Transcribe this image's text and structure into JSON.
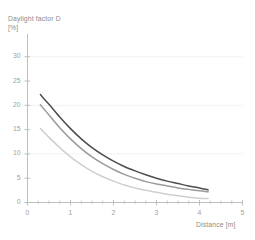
{
  "chart_data": {
    "type": "line",
    "title": "",
    "ylabel": "Daylight factor D",
    "yunit": "[%]",
    "xlabel": "Distance [m]",
    "xlim": [
      0,
      5
    ],
    "ylim": [
      0,
      32
    ],
    "grid": true,
    "grid_axis": "y",
    "legend": "none",
    "xticks": [
      0,
      1,
      2,
      3,
      4,
      5
    ],
    "xtick_labels": [
      "0",
      "1",
      "2",
      "3",
      "4",
      "5"
    ],
    "yticks": [
      0,
      5,
      10,
      15,
      20,
      25,
      30
    ],
    "ytick_labels": [
      "0",
      "5",
      "10",
      "15",
      "20",
      "25",
      "30"
    ],
    "xminor_ticks": [
      0.25,
      0.5,
      0.75,
      1.25,
      1.5,
      1.75,
      2.25,
      2.5,
      2.75,
      3.25,
      3.5,
      3.75,
      4.25,
      4.5,
      4.75
    ],
    "gridlines_y": [
      10,
      20,
      30
    ],
    "x": [
      0.3,
      0.5,
      0.75,
      1.0,
      1.25,
      1.5,
      1.75,
      2.0,
      2.25,
      2.5,
      2.75,
      3.0,
      3.25,
      3.5,
      3.75,
      4.0,
      4.2
    ],
    "series": [
      {
        "name": "curve-dark",
        "color": "#4d4d4d",
        "values": [
          22.2,
          20.2,
          17.6,
          15.2,
          13.1,
          11.3,
          9.8,
          8.5,
          7.4,
          6.5,
          5.7,
          5.0,
          4.4,
          3.9,
          3.4,
          3.0,
          2.6
        ]
      },
      {
        "name": "curve-medium",
        "color": "#9b9b9b",
        "values": [
          20.1,
          18.0,
          15.4,
          13.1,
          11.1,
          9.4,
          8.0,
          6.8,
          5.8,
          5.0,
          4.3,
          3.8,
          3.4,
          3.0,
          2.7,
          2.4,
          2.2
        ]
      },
      {
        "name": "curve-light",
        "color": "#cfcfcf",
        "values": [
          15.2,
          13.4,
          11.3,
          9.4,
          7.8,
          6.4,
          5.3,
          4.4,
          3.6,
          3.0,
          2.5,
          2.1,
          1.7,
          1.4,
          1.1,
          0.9,
          0.8
        ]
      }
    ],
    "colors": {
      "axis": "#bfbfbf",
      "grid": "#f2f2f2",
      "tick_text": "#a0a0a0",
      "title_text": "#8c8c8c",
      "background": "#ffffff"
    }
  }
}
